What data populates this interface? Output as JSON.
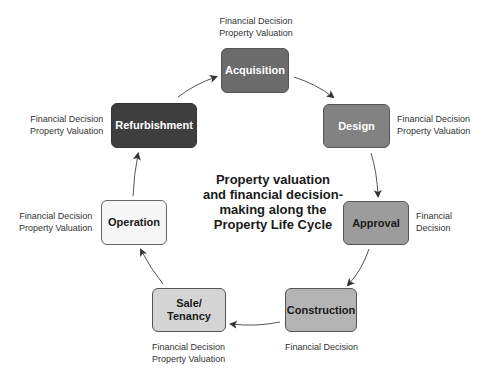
{
  "diagram": {
    "center_title": [
      "Property valuation",
      "and financial decision-",
      "making along the",
      "Property Life Cycle"
    ],
    "stages": [
      {
        "id": "acquisition",
        "label": [
          "Acquisition"
        ],
        "fill": "#6b6b6b",
        "text_color": "#ffffff",
        "notes": [
          "Financial Decision",
          "Property Valuation"
        ]
      },
      {
        "id": "design",
        "label": [
          "Design"
        ],
        "fill": "#828282",
        "text_color": "#ffffff",
        "notes": [
          "Financial Decision",
          "Property Valuation"
        ]
      },
      {
        "id": "approval",
        "label": [
          "Approval"
        ],
        "fill": "#9c9c9c",
        "text_color": "#1a1a1a",
        "notes": [
          "Financial",
          "Decision"
        ]
      },
      {
        "id": "construction",
        "label": [
          "Construction"
        ],
        "fill": "#b4b4b4",
        "text_color": "#1a1a1a",
        "notes": [
          "Financial Decision"
        ]
      },
      {
        "id": "sale-tenancy",
        "label": [
          "Sale/",
          "Tenancy"
        ],
        "fill": "#d4d4d4",
        "text_color": "#1a1a1a",
        "notes": [
          "Financial Decision",
          "Property Valuation"
        ]
      },
      {
        "id": "operation",
        "label": [
          "Operation"
        ],
        "fill": "#f6f6f6",
        "text_color": "#1a1a1a",
        "notes": [
          "Financial Decision",
          "Property Valuation"
        ]
      },
      {
        "id": "refurbishment",
        "label": [
          "Refurbishment"
        ],
        "fill": "#3e3e3e",
        "text_color": "#ffffff",
        "notes": [
          "Financial Decision",
          "Property Valuation"
        ]
      }
    ],
    "flow": [
      "acquisition",
      "design",
      "approval",
      "construction",
      "sale-tenancy",
      "operation",
      "refurbishment",
      "acquisition"
    ],
    "arrow_color": "#444444"
  }
}
